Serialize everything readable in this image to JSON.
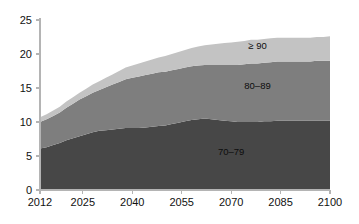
{
  "chart_data": {
    "type": "area",
    "stacked": true,
    "title": "",
    "subtitle": "",
    "xlabel": "",
    "ylabel": "",
    "xlim": [
      2012,
      2100
    ],
    "ylim": [
      0,
      25
    ],
    "grid": false,
    "legend_position": "inline-annotations",
    "x_tick_labels": [
      "2012",
      "2025",
      "2040",
      "2055",
      "2070",
      "2085",
      "2100"
    ],
    "x_ticks": [
      2012,
      2025,
      2040,
      2055,
      2070,
      2085,
      2100
    ],
    "y_tick_labels": [
      "0",
      "5",
      "10",
      "15",
      "20",
      "25"
    ],
    "y_ticks": [
      0,
      5,
      10,
      15,
      20,
      25
    ],
    "x": [
      2012,
      2014,
      2016,
      2018,
      2020,
      2022,
      2024,
      2026,
      2028,
      2030,
      2032,
      2034,
      2036,
      2038,
      2040,
      2042,
      2044,
      2046,
      2048,
      2050,
      2052,
      2054,
      2056,
      2058,
      2060,
      2062,
      2064,
      2066,
      2068,
      2070,
      2072,
      2074,
      2076,
      2078,
      2080,
      2082,
      2084,
      2086,
      2088,
      2090,
      2092,
      2094,
      2096,
      2098,
      2100
    ],
    "series": [
      {
        "name": "70-79",
        "label": "70–79",
        "color": "#474747",
        "values": [
          6.1,
          6.3,
          6.6,
          6.9,
          7.3,
          7.6,
          7.9,
          8.2,
          8.5,
          8.7,
          8.8,
          8.9,
          9.0,
          9.1,
          9.1,
          9.1,
          9.2,
          9.3,
          9.4,
          9.5,
          9.7,
          9.9,
          10.1,
          10.3,
          10.4,
          10.5,
          10.4,
          10.3,
          10.2,
          10.1,
          10.0,
          10.0,
          10.0,
          10.0,
          10.1,
          10.1,
          10.2,
          10.2,
          10.2,
          10.2,
          10.2,
          10.2,
          10.2,
          10.2,
          10.2
        ]
      },
      {
        "name": "80-89",
        "label": "80–89",
        "color": "#7e7e7e",
        "values": [
          3.9,
          4.1,
          4.3,
          4.5,
          4.8,
          5.1,
          5.4,
          5.6,
          5.8,
          6.0,
          6.3,
          6.6,
          6.9,
          7.2,
          7.4,
          7.6,
          7.7,
          7.8,
          7.9,
          7.9,
          7.9,
          7.9,
          7.9,
          7.9,
          7.9,
          7.9,
          8.0,
          8.1,
          8.2,
          8.3,
          8.4,
          8.5,
          8.6,
          8.6,
          8.6,
          8.7,
          8.7,
          8.7,
          8.7,
          8.7,
          8.7,
          8.7,
          8.8,
          8.8,
          8.8
        ]
      },
      {
        "name": "90+",
        "label": "≥ 90",
        "color": "#c3c3c3",
        "values": [
          0.7,
          0.75,
          0.8,
          0.85,
          0.9,
          0.95,
          1.0,
          1.1,
          1.2,
          1.3,
          1.4,
          1.5,
          1.6,
          1.7,
          1.8,
          1.9,
          2.0,
          2.1,
          2.2,
          2.3,
          2.4,
          2.5,
          2.6,
          2.7,
          2.8,
          2.9,
          3.0,
          3.1,
          3.2,
          3.3,
          3.4,
          3.4,
          3.5,
          3.5,
          3.5,
          3.5,
          3.5,
          3.5,
          3.5,
          3.5,
          3.5,
          3.5,
          3.5,
          3.5,
          3.6
        ]
      }
    ],
    "annotations": [
      {
        "text": "≥ 90",
        "x": 2078,
        "y": 20.8
      },
      {
        "text": "80–89",
        "x": 2078,
        "y": 14.8
      },
      {
        "text": "70–79",
        "x": 2070,
        "y": 5.2
      }
    ]
  }
}
